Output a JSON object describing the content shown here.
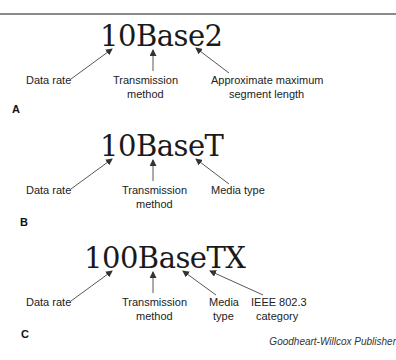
{
  "panels": [
    {
      "letter": "A",
      "term": "10Base2",
      "labels": {
        "data_rate": "Data rate",
        "transmission_1": "Transmission",
        "transmission_2": "method",
        "third_1": "Approximate maximum",
        "third_2": "segment length"
      }
    },
    {
      "letter": "B",
      "term": "10BaseT",
      "labels": {
        "data_rate": "Data rate",
        "transmission_1": "Transmission",
        "transmission_2": "method",
        "third_1": "Media type"
      }
    },
    {
      "letter": "C",
      "term": "100BaseTX",
      "labels": {
        "data_rate": "Data rate",
        "transmission_1": "Transmission",
        "transmission_2": "method",
        "media_1": "Media",
        "media_2": "type",
        "ieee_1": "IEEE 802.3",
        "ieee_2": "category"
      }
    }
  ],
  "credit": "Goodheart-Willcox Publisher",
  "colors": {
    "rule": "#8a8a8a",
    "arrow": "#333333",
    "text": "#222222"
  }
}
